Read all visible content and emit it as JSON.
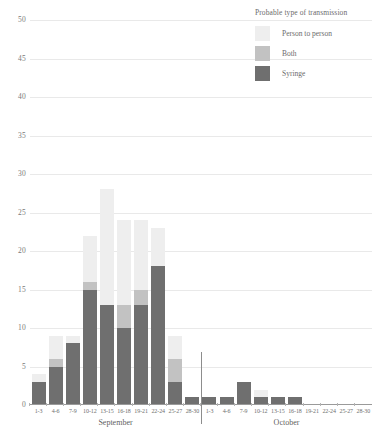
{
  "chart_data": {
    "type": "bar",
    "stacked": true,
    "title": "",
    "xlabel": "",
    "ylabel": "",
    "ylim": [
      0,
      50
    ],
    "ytick_step": 5,
    "yticks": [
      50,
      45,
      40,
      35,
      30,
      25,
      20,
      15,
      10,
      5,
      0
    ],
    "grid": true,
    "legend_position": "top-right",
    "legend_title": "Probable type of transmission",
    "series": [
      {
        "name": "Person to person",
        "color": "#eeeeee",
        "values": [
          1,
          3,
          1,
          6,
          15,
          11,
          9,
          5,
          3,
          0,
          0,
          0,
          0,
          1,
          0,
          0,
          0,
          0,
          0,
          0
        ]
      },
      {
        "name": "Both",
        "color": "#c2c2c2",
        "values": [
          0,
          1,
          0,
          1,
          0,
          3,
          2,
          0,
          3,
          0,
          0,
          0,
          0,
          0,
          0,
          0,
          0,
          0,
          0,
          0
        ]
      },
      {
        "name": "Syringe",
        "color": "#6f6f6f",
        "values": [
          3,
          5,
          8,
          15,
          13,
          10,
          13,
          18,
          3,
          1,
          1,
          1,
          3,
          1,
          1,
          1,
          0,
          0,
          0,
          0
        ]
      }
    ],
    "totals": [
      4,
      9,
      9,
      22,
      28,
      24,
      24,
      23,
      9,
      1,
      1,
      1,
      3,
      2,
      1,
      1,
      0,
      0,
      0,
      0
    ],
    "categories": [
      "1-3",
      "4-6",
      "7-9",
      "10-12",
      "13-15",
      "16-18",
      "19-21",
      "22-24",
      "25-27",
      "28-30",
      "1-3",
      "4-6",
      "7-9",
      "10-12",
      "13-15",
      "16-18",
      "19-21",
      "22-24",
      "25-27",
      "28-30"
    ],
    "groups": [
      {
        "label": "September",
        "start": 0,
        "count": 10
      },
      {
        "label": "October",
        "start": 10,
        "count": 10
      }
    ]
  },
  "legend": {
    "title": "Probable type of transmission",
    "items": [
      {
        "label": "Person to person",
        "color": "#eeeeee"
      },
      {
        "label": "Both",
        "color": "#c2c2c2"
      },
      {
        "label": "Syringe",
        "color": "#6f6f6f"
      }
    ]
  },
  "axes": {
    "y": {
      "ticks": [
        "50",
        "45",
        "40",
        "35",
        "30",
        "25",
        "20",
        "15",
        "10",
        "5",
        "0"
      ]
    },
    "x": {
      "ticks": [
        "1-3",
        "4-6",
        "7-9",
        "10-12",
        "13-15",
        "16-18",
        "19-21",
        "22-24",
        "25-27",
        "28-30",
        "1-3",
        "4-6",
        "7-9",
        "10-12",
        "13-15",
        "16-18",
        "19-21",
        "22-24",
        "25-27",
        "28-30"
      ],
      "month_labels": [
        "September",
        "October"
      ]
    }
  }
}
